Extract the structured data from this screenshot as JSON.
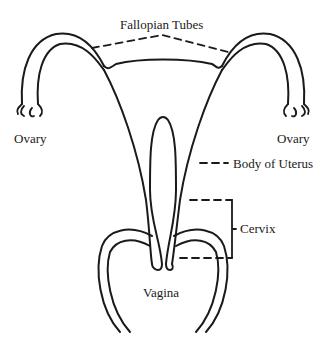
{
  "diagram": {
    "line_color": "#1a1a1a",
    "background": "#ffffff",
    "labels": {
      "fallopian_tubes": "Fallopian Tubes",
      "ovary_left": "Ovary",
      "ovary_right": "Ovary",
      "body_of_uterus": "Body of Uterus",
      "cervix": "Cervix",
      "vagina": "Vagina"
    }
  }
}
